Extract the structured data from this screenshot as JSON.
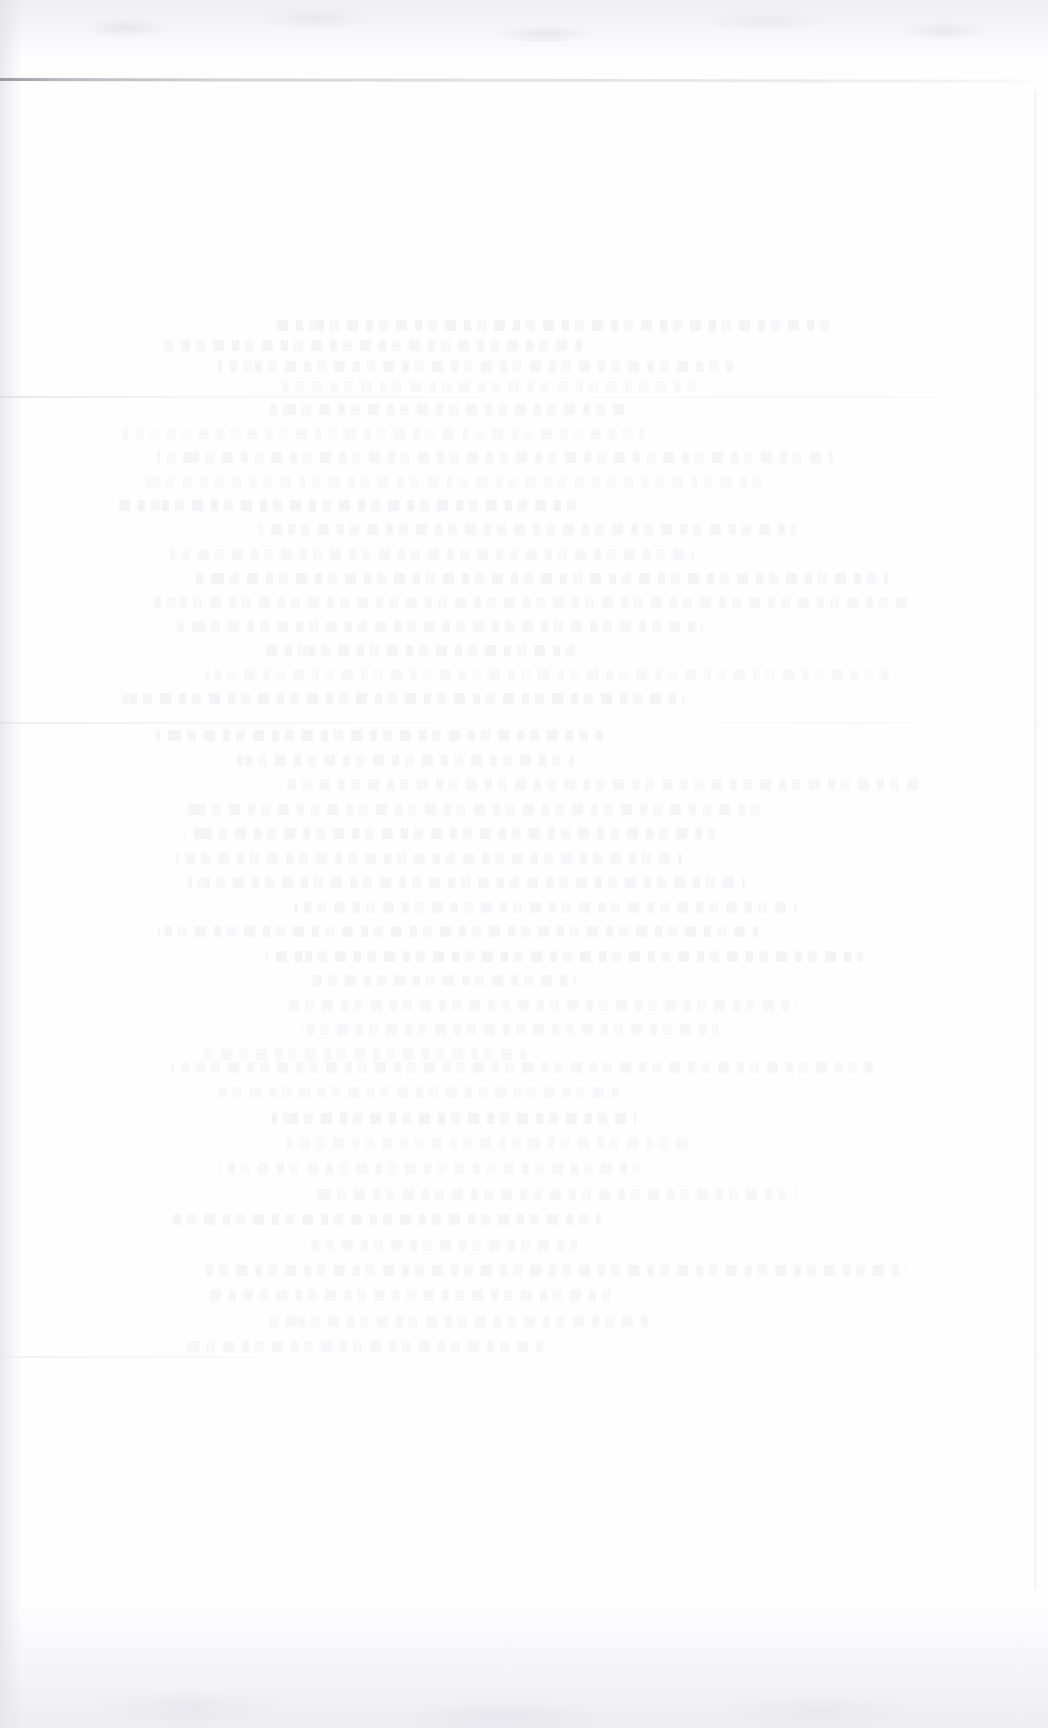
{
  "document": {
    "kind": "scanned-page",
    "state": "blank",
    "legible_text": "",
    "note": "No legible text, headings, labels, or UI controls are present in the image."
  },
  "canvas": {
    "width_px": 1048,
    "height_px": 1728,
    "background_color": "#ffffff",
    "paper_tone_color": "#fefeff"
  },
  "rules": [
    {
      "name": "top-rule",
      "y_px": 78,
      "x_start_px": 0,
      "x_end_px": 1030,
      "thickness_px": 3,
      "color": "#96969e",
      "emphasis": "darkest feature on the page; fades left-to-right"
    },
    {
      "name": "faint-rule-upper",
      "y_px": 396,
      "x_start_px": 0,
      "x_end_px": 1048,
      "thickness_px": 2,
      "color": "#d6d6de",
      "emphasis": "very faint, full width"
    },
    {
      "name": "faint-rule-middle",
      "y_px": 722,
      "x_start_px": 0,
      "x_end_px": 1048,
      "thickness_px": 2,
      "color": "#dcdce4",
      "emphasis": "very faint, full width"
    },
    {
      "name": "faint-rule-lower",
      "y_px": 1356,
      "x_start_px": 0,
      "x_end_px": 1048,
      "thickness_px": 2,
      "color": "#e2e2ea",
      "emphasis": "barely visible, full width"
    }
  ],
  "texture_regions": [
    {
      "name": "top-mottled-band",
      "x_px": 0,
      "y_px": 0,
      "width_px": 1048,
      "height_px": 62,
      "color": "#e2e2e8"
    },
    {
      "name": "left-edge-shading",
      "x_px": 0,
      "y_px": 0,
      "width_px": 22,
      "height_px": 1728,
      "color": "#ddddE4"
    },
    {
      "name": "right-edge-line",
      "x_px": 1034,
      "y_px": 90,
      "width_px": 3,
      "height_px": 1500,
      "color": "#e4e4eb"
    },
    {
      "name": "bottom-shading-band",
      "x_px": 0,
      "y_px": 1598,
      "width_px": 1048,
      "height_px": 130,
      "color": "#e1e1e8"
    }
  ],
  "ghost_text_regions": [
    {
      "name": "ghost-block-upper",
      "x_px": 150,
      "y_px": 320,
      "width_px": 800,
      "height_px": 72,
      "line_count": 4
    },
    {
      "name": "ghost-block-upper-mid",
      "x_px": 110,
      "y_px": 404,
      "width_px": 860,
      "height_px": 300,
      "line_count": 13
    },
    {
      "name": "ghost-block-lower-mid",
      "x_px": 150,
      "y_px": 730,
      "width_px": 820,
      "height_px": 330,
      "line_count": 14
    },
    {
      "name": "ghost-block-lower",
      "x_px": 160,
      "y_px": 1062,
      "width_px": 790,
      "height_px": 290,
      "line_count": 12
    }
  ]
}
